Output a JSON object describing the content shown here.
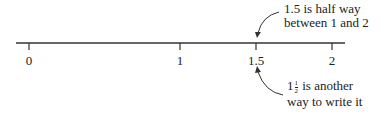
{
  "number_line": {
    "ticks": [
      {
        "label": "0",
        "value": 0
      },
      {
        "label": "1",
        "value": 1
      },
      {
        "label": "1.5",
        "value": 1.5
      },
      {
        "label": "2",
        "value": 2
      }
    ]
  },
  "annotations": {
    "top": {
      "line1": "1.5 is half way",
      "line2": "between 1 and 2"
    },
    "bottom": {
      "whole": "1",
      "numerator": "1",
      "denominator": "2",
      "line1_rest": " is another",
      "line2": "way to write it"
    }
  }
}
